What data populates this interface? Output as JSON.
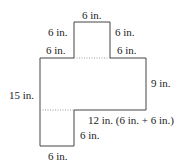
{
  "diagram": {
    "type": "composite-rectilinear-shape",
    "colors": {
      "outline": "#444444",
      "dotted": "#999999",
      "text": "#222222"
    },
    "shape": {
      "outline_points": [
        [
          74,
          22
        ],
        [
          110,
          22
        ],
        [
          110,
          58
        ],
        [
          146,
          58
        ],
        [
          146,
          110
        ],
        [
          74,
          110
        ],
        [
          74,
          146
        ],
        [
          40,
          146
        ],
        [
          40,
          58
        ],
        [
          74,
          58
        ]
      ],
      "dotted_lines": [
        [
          [
            74,
            58
          ],
          [
            110,
            58
          ]
        ],
        [
          [
            40,
            110
          ],
          [
            74,
            110
          ]
        ]
      ]
    },
    "labels": {
      "top": "6 in.",
      "top_square_left": "6 in.",
      "top_square_right": "6 in.",
      "left_ledge": "6 in.",
      "right_ledge": "6 in.",
      "left_side": "15 in.",
      "right_side": "9 in.",
      "bottom_step": "12 in. (6 in. + 6 in.)",
      "leg_right": "6 in.",
      "bottom": "6 in."
    }
  }
}
